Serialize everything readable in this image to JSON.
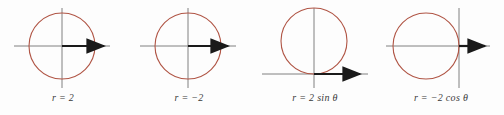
{
  "figure": {
    "type": "polar-circle-figure-strip",
    "background_color": "#fdfdfd",
    "curve_color": "#b05545",
    "axis_color": "#808080",
    "vector_color": "#1a1a1a",
    "label_color": "#3a3a3a",
    "panel_count": 4
  },
  "panels": [
    {
      "id": "panel-r-equals-2",
      "label": "r = 2",
      "label_parts": {
        "variable": "r",
        "operator": "=",
        "value": "2"
      },
      "equation": "r = 2",
      "description": "circle of radius 2 centered at the pole",
      "circle": {
        "cx": 62,
        "cy": 46,
        "r": 33
      },
      "axes": {
        "x_axis": {
          "x1": 14,
          "y1": 46,
          "x2": 110,
          "y2": 46
        },
        "y_axis": {
          "x1": 62,
          "y1": 8,
          "x2": 62,
          "y2": 88
        }
      },
      "radius_vector": {
        "x1": 62,
        "y1": 46,
        "x2": 110,
        "y2": 46,
        "direction": "right"
      }
    },
    {
      "id": "panel-r-equals-negative-2",
      "label": "r = −2",
      "label_parts": {
        "variable": "r",
        "operator": "=",
        "value": "−2"
      },
      "equation": "r = -2",
      "description": "circle of radius 2 centered at the pole",
      "circle": {
        "cx": 62,
        "cy": 46,
        "r": 33
      },
      "axes": {
        "x_axis": {
          "x1": 14,
          "y1": 46,
          "x2": 110,
          "y2": 46
        },
        "y_axis": {
          "x1": 62,
          "y1": 8,
          "x2": 62,
          "y2": 88
        }
      },
      "radius_vector": {
        "x1": 62,
        "y1": 46,
        "x2": 108,
        "y2": 46,
        "direction": "right"
      }
    },
    {
      "id": "panel-r-equals-2-sin-theta",
      "label": "r = 2 sin θ",
      "label_parts": {
        "variable": "r",
        "operator": "=",
        "coefficient": "2",
        "function": "sin",
        "angle": "θ"
      },
      "equation": "r = 2 sin(theta)",
      "description": "circle of diameter 2 tangent to the polar axis at the pole, centered above",
      "circle": {
        "cx": 62,
        "cy": 41,
        "r": 33
      },
      "axes": {
        "x_axis": {
          "x1": 10,
          "y1": 74,
          "x2": 116,
          "y2": 74
        },
        "y_axis": {
          "x1": 62,
          "y1": 8,
          "x2": 62,
          "y2": 88
        }
      },
      "radius_vector": {
        "x1": 62,
        "y1": 74,
        "x2": 114,
        "y2": 74,
        "direction": "right"
      }
    },
    {
      "id": "panel-r-equals-negative-2-cos-theta",
      "label": "r = −2 cos θ",
      "label_parts": {
        "variable": "r",
        "operator": "=",
        "coefficient": "−2",
        "function": "cos",
        "angle": "θ"
      },
      "equation": "r = -2 cos(theta)",
      "description": "circle of diameter 2 tangent to the vertical axis at the pole, centered to the left",
      "circle": {
        "cx": 48,
        "cy": 46,
        "r": 33
      },
      "axes": {
        "x_axis": {
          "x1": 8,
          "y1": 46,
          "x2": 112,
          "y2": 46
        },
        "y_axis": {
          "x1": 81,
          "y1": 8,
          "x2": 81,
          "y2": 88
        }
      },
      "radius_vector": {
        "x1": 81,
        "y1": 46,
        "x2": 113,
        "y2": 46,
        "direction": "right"
      }
    }
  ]
}
